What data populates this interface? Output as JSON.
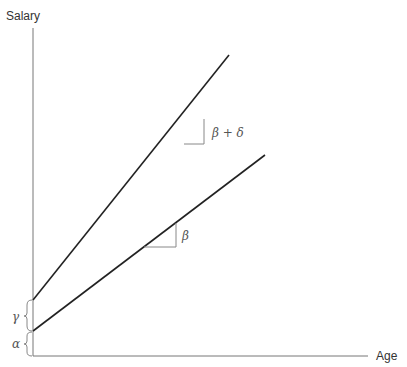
{
  "diagram": {
    "y_axis_label": "Salary",
    "x_axis_label": "Age",
    "lines": [
      {
        "name": "upper-line",
        "slope_label": "β + δ",
        "intercept_label": "γ"
      },
      {
        "name": "lower-line",
        "slope_label": "β",
        "intercept_label": "α"
      }
    ],
    "colors": {
      "line": "#222222",
      "axis": "#777777",
      "triangle": "#888888"
    }
  }
}
